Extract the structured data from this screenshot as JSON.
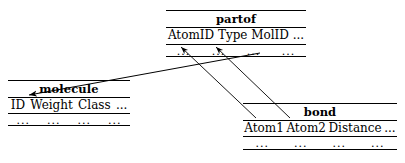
{
  "diagram": {
    "type": "relational-schema",
    "title_visible": false,
    "line_color": "#000000",
    "background": "#ffffff"
  },
  "tables": [
    {
      "id": "partof",
      "name": "partof",
      "x": 166,
      "y": 10,
      "width": 140,
      "height": 47,
      "title_y": 11,
      "columns": [
        "AtomID",
        "Type",
        "MolID",
        "..."
      ],
      "ellipsis_row": [
        "...",
        "...",
        "...",
        "..."
      ],
      "rules_y": [
        10,
        27,
        44,
        56
      ]
    },
    {
      "id": "molecule",
      "name": "molecule",
      "x": 8,
      "y": 80,
      "width": 122,
      "height": 46,
      "title_y": 81,
      "columns": [
        "ID",
        "Weight",
        "Class",
        "..."
      ],
      "ellipsis_row": [
        "...",
        "...",
        "...",
        "..."
      ],
      "rules_y": [
        80,
        97,
        113,
        125
      ]
    },
    {
      "id": "bond",
      "name": "bond",
      "x": 243,
      "y": 103,
      "width": 154,
      "height": 47,
      "title_y": 104,
      "columns": [
        "Atom1",
        "Atom2",
        "Distance",
        "..."
      ],
      "ellipsis_row": [
        "...",
        "...",
        "...",
        "..."
      ],
      "rules_y": [
        103,
        120,
        136,
        149
      ]
    }
  ],
  "relationships": [
    {
      "id": "partof-molid-to-molecule-id",
      "label": "foreign-key MolID to molecule ID",
      "from_table": "partof",
      "from_column": "MolID",
      "to_table": "molecule",
      "to_column": "ID",
      "from_x": 260,
      "from_y": 53,
      "to_x": 29,
      "to_y": 95
    },
    {
      "id": "bond-atom1-to-partof-atomid",
      "label": "foreign-key Atom1 to partof AtomID",
      "from_table": "bond",
      "from_column": "Atom1",
      "to_table": "partof",
      "to_column": "AtomID",
      "from_x": 256,
      "from_y": 118,
      "to_x": 181,
      "to_y": 47
    },
    {
      "id": "bond-atom2-to-partof-atomid",
      "label": "foreign-key Atom2 to partof AtomID",
      "from_table": "bond",
      "from_column": "Atom2",
      "to_table": "partof",
      "to_column": "AtomID",
      "from_x": 290,
      "from_y": 118,
      "to_x": 216,
      "to_y": 47
    }
  ]
}
